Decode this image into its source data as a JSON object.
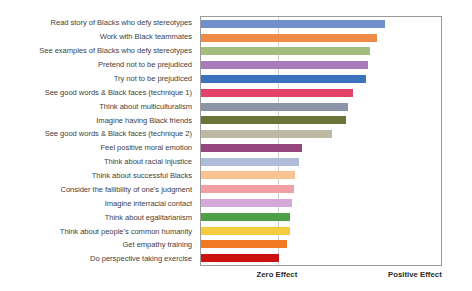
{
  "chart_data": {
    "type": "bar",
    "orientation": "horizontal",
    "title": "",
    "xlabel": "",
    "ylabel": "",
    "grid": true,
    "legend": "none",
    "axis_captions": {
      "zero": "Zero Effect",
      "positive": "Positive Effect"
    },
    "axis_tick_positions_px": {
      "zero": 77,
      "positive_right_edge": 242
    },
    "xlim_note": "Axis unlabeled numerically; ticks shown are 'Zero Effect' and 'Positive Effect'.",
    "categories": [
      "Read story of Blacks who defy stereotypes",
      "Work with Black teammates",
      "See examples of Blacks who defy stereotypes",
      "Pretend not to be prejudiced",
      "Try not to be prejudiced",
      "See good words & Black faces (technique 1)",
      "Think about multiculturalism",
      "Imagine having Black friends",
      "See good words & Black faces (technique 2)",
      "Feel positive moral emotion",
      "Think about racial injustice",
      "Think about successful Blacks",
      "Consider the fallibility of one's judgment",
      "Imagine interracial contact",
      "Think about egalitarianism",
      "Think about people's common humanity",
      "Get empathy training",
      "Do perspective taking exercise"
    ],
    "values": [
      184,
      176,
      169,
      167,
      165,
      152,
      147,
      145,
      131,
      101,
      98,
      94,
      93,
      91,
      89,
      89,
      86,
      78
    ],
    "value_units": "pixels from plot left edge (axis is unlabeled; lengths encode effect size)",
    "colors": [
      "#6f8fcd",
      "#ef8b47",
      "#a3bd7c",
      "#a87cb9",
      "#3a74bd",
      "#e1436a",
      "#8b94a8",
      "#6b7339",
      "#bdb8a4",
      "#96467f",
      "#aebcd9",
      "#f7c392",
      "#f0a0a4",
      "#d4a8d8",
      "#4ba048",
      "#f5cc3f",
      "#f07a22",
      "#cc1111"
    ]
  }
}
